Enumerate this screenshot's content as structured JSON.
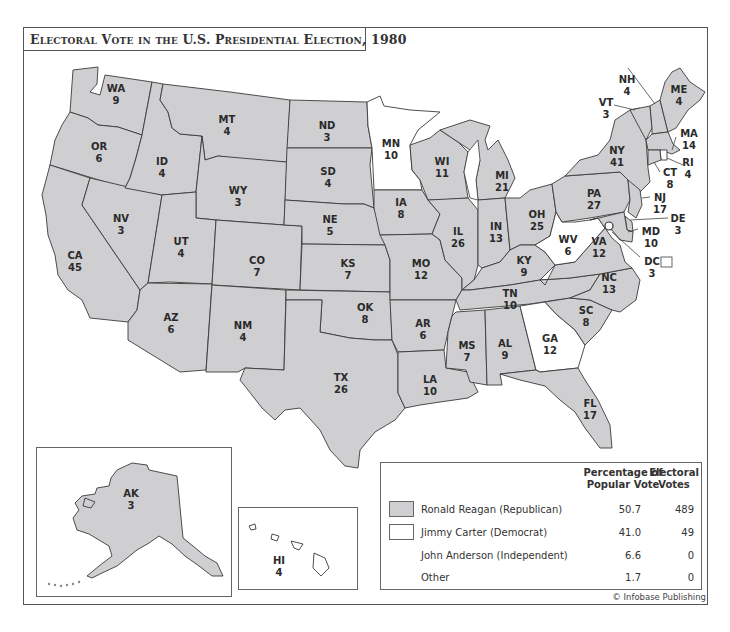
{
  "title": "Electoral Vote in the U.S. Presidential Election, 1980",
  "credit": "© Infobase Publishing",
  "colors": {
    "republican": "#cfcfd1",
    "democrat": "#ffffff",
    "border": "#3a3a3a",
    "frame": "#555555"
  },
  "states": {
    "WA": {
      "abbr": "WA",
      "votes": "9",
      "winner": "Reagan"
    },
    "OR": {
      "abbr": "OR",
      "votes": "6",
      "winner": "Reagan"
    },
    "CA": {
      "abbr": "CA",
      "votes": "45",
      "winner": "Reagan"
    },
    "NV": {
      "abbr": "NV",
      "votes": "3",
      "winner": "Reagan"
    },
    "ID": {
      "abbr": "ID",
      "votes": "4",
      "winner": "Reagan"
    },
    "MT": {
      "abbr": "MT",
      "votes": "4",
      "winner": "Reagan"
    },
    "WY": {
      "abbr": "WY",
      "votes": "3",
      "winner": "Reagan"
    },
    "UT": {
      "abbr": "UT",
      "votes": "4",
      "winner": "Reagan"
    },
    "CO": {
      "abbr": "CO",
      "votes": "7",
      "winner": "Reagan"
    },
    "AZ": {
      "abbr": "AZ",
      "votes": "6",
      "winner": "Reagan"
    },
    "NM": {
      "abbr": "NM",
      "votes": "4",
      "winner": "Reagan"
    },
    "ND": {
      "abbr": "ND",
      "votes": "3",
      "winner": "Reagan"
    },
    "SD": {
      "abbr": "SD",
      "votes": "4",
      "winner": "Reagan"
    },
    "NE": {
      "abbr": "NE",
      "votes": "5",
      "winner": "Reagan"
    },
    "KS": {
      "abbr": "KS",
      "votes": "7",
      "winner": "Reagan"
    },
    "OK": {
      "abbr": "OK",
      "votes": "8",
      "winner": "Reagan"
    },
    "TX": {
      "abbr": "TX",
      "votes": "26",
      "winner": "Reagan"
    },
    "MN": {
      "abbr": "MN",
      "votes": "10",
      "winner": "Carter"
    },
    "IA": {
      "abbr": "IA",
      "votes": "8",
      "winner": "Reagan"
    },
    "MO": {
      "abbr": "MO",
      "votes": "12",
      "winner": "Reagan"
    },
    "AR": {
      "abbr": "AR",
      "votes": "6",
      "winner": "Reagan"
    },
    "LA": {
      "abbr": "LA",
      "votes": "10",
      "winner": "Reagan"
    },
    "WI": {
      "abbr": "WI",
      "votes": "11",
      "winner": "Reagan"
    },
    "IL": {
      "abbr": "IL",
      "votes": "26",
      "winner": "Reagan"
    },
    "MI": {
      "abbr": "MI",
      "votes": "21",
      "winner": "Reagan"
    },
    "IN": {
      "abbr": "IN",
      "votes": "13",
      "winner": "Reagan"
    },
    "OH": {
      "abbr": "OH",
      "votes": "25",
      "winner": "Reagan"
    },
    "KY": {
      "abbr": "KY",
      "votes": "9",
      "winner": "Reagan"
    },
    "TN": {
      "abbr": "TN",
      "votes": "10",
      "winner": "Reagan"
    },
    "MS": {
      "abbr": "MS",
      "votes": "7",
      "winner": "Reagan"
    },
    "AL": {
      "abbr": "AL",
      "votes": "9",
      "winner": "Reagan"
    },
    "GA": {
      "abbr": "GA",
      "votes": "12",
      "winner": "Carter"
    },
    "FL": {
      "abbr": "FL",
      "votes": "17",
      "winner": "Reagan"
    },
    "SC": {
      "abbr": "SC",
      "votes": "8",
      "winner": "Reagan"
    },
    "NC": {
      "abbr": "NC",
      "votes": "13",
      "winner": "Reagan"
    },
    "VA": {
      "abbr": "VA",
      "votes": "12",
      "winner": "Reagan"
    },
    "WV": {
      "abbr": "WV",
      "votes": "6",
      "winner": "Carter"
    },
    "PA": {
      "abbr": "PA",
      "votes": "27",
      "winner": "Reagan"
    },
    "NY": {
      "abbr": "NY",
      "votes": "41",
      "winner": "Reagan"
    },
    "VT": {
      "abbr": "VT",
      "votes": "3",
      "winner": "Reagan"
    },
    "NH": {
      "abbr": "NH",
      "votes": "4",
      "winner": "Reagan"
    },
    "ME": {
      "abbr": "ME",
      "votes": "4",
      "winner": "Reagan"
    },
    "MA": {
      "abbr": "MA",
      "votes": "14",
      "winner": "Reagan"
    },
    "RI": {
      "abbr": "RI",
      "votes": "4",
      "winner": "Carter"
    },
    "CT": {
      "abbr": "CT",
      "votes": "8",
      "winner": "Reagan"
    },
    "NJ": {
      "abbr": "NJ",
      "votes": "17",
      "winner": "Reagan"
    },
    "DE": {
      "abbr": "DE",
      "votes": "3",
      "winner": "Reagan"
    },
    "MD": {
      "abbr": "MD",
      "votes": "10",
      "winner": "Carter"
    },
    "DC": {
      "abbr": "DC",
      "votes": "3",
      "winner": "Carter"
    },
    "AK": {
      "abbr": "AK",
      "votes": "3",
      "winner": "Reagan"
    },
    "HI": {
      "abbr": "HI",
      "votes": "4",
      "winner": "Carter"
    }
  },
  "legend": {
    "headers": {
      "pct": "Percentage of Popular Vote",
      "pct_line1": "Percentage of",
      "pct_line2": "Popular Vote",
      "ev_line1": "Electoral",
      "ev_line2": "Votes"
    },
    "rows": [
      {
        "name": "Ronald Reagan (Republican)",
        "pct": "50.7",
        "ev": "489",
        "swatch": "#cfcfd1"
      },
      {
        "name": "Jimmy Carter (Democrat)",
        "pct": "41.0",
        "ev": "49",
        "swatch": "#ffffff"
      },
      {
        "name": "John Anderson (Independent)",
        "pct": "6.6",
        "ev": "0",
        "swatch": null
      },
      {
        "name": "Other",
        "pct": "1.7",
        "ev": "0",
        "swatch": null
      }
    ]
  }
}
